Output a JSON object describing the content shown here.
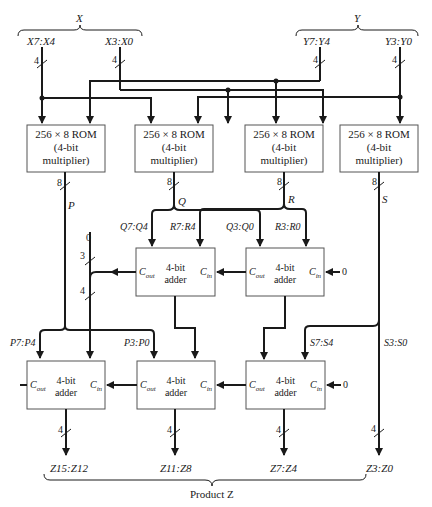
{
  "inputs": {
    "x_group": {
      "label": "X",
      "high": "X7:X4",
      "low": "X3:X0",
      "high_width": "4",
      "low_width": "4"
    },
    "y_group": {
      "label": "Y",
      "high": "Y7:Y4",
      "low": "Y3:Y0",
      "high_width": "4",
      "low_width": "4"
    }
  },
  "roms": [
    {
      "line1": "256 × 8 ROM",
      "line2": "(4-bit",
      "line3": "multiplier)",
      "out_width": "8",
      "out_label": "P"
    },
    {
      "line1": "256 × 8 ROM",
      "line2": "(4-bit",
      "line3": "multiplier)",
      "out_width": "8",
      "out_label": "Q"
    },
    {
      "line1": "256 × 8 ROM",
      "line2": "(4-bit",
      "line3": "multiplier)",
      "out_width": "8",
      "out_label": "R"
    },
    {
      "line1": "256 × 8 ROM",
      "line2": "(4-bit",
      "line3": "multiplier)",
      "out_width": "8",
      "out_label": "S"
    }
  ],
  "signals": {
    "q_high": "Q7:Q4",
    "r_high": "R7:R4",
    "q_low": "Q3:Q0",
    "r_low": "R3:R0",
    "p_high": "P7:P4",
    "p_low": "P3:P0",
    "s_high": "S7:S4",
    "s_low": "S3:S0",
    "zero_top": "0",
    "width_3": "3",
    "width_4": "4"
  },
  "adders": {
    "label_line1": "4-bit",
    "label_line2": "adder",
    "cout": "C",
    "cout_sub": "out",
    "cin": "C",
    "cin_sub": "in",
    "zero": "0"
  },
  "outputs": [
    {
      "label": "Z15:Z12",
      "width": "4"
    },
    {
      "label": "Z11:Z8",
      "width": "4"
    },
    {
      "label": "Z7:Z4",
      "width": "4"
    },
    {
      "label": "Z3:Z0",
      "width": "4"
    }
  ],
  "product_label": "Product Z"
}
